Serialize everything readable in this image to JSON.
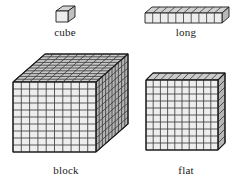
{
  "page": {
    "background_color": "#ffffff",
    "width": 236,
    "height": 184
  },
  "style": {
    "stroke_color": "#1c1c1c",
    "face_front_color": "#e9e9e9",
    "face_top_color": "#d0d0d0",
    "face_side_color": "#bdbdbd",
    "grid_line_color": "#3a3a3a",
    "label_color": "#1a1a1a"
  },
  "figures": [
    {
      "id": "cube",
      "label": "cube",
      "icon": "unit-cube-icon",
      "units": 1,
      "dimensions": {
        "width": 1,
        "height": 1,
        "depth": 1
      },
      "front_grid": {
        "cols": 1,
        "rows": 1
      },
      "top_grid": {
        "cols": 1,
        "rows": 1
      },
      "side_grid": {
        "cols": 1,
        "rows": 1
      }
    },
    {
      "id": "long",
      "label": "long",
      "icon": "rod-of-ten-icon",
      "units": 10,
      "dimensions": {
        "width": 10,
        "height": 1,
        "depth": 1
      },
      "front_grid": {
        "cols": 10,
        "rows": 1
      },
      "top_grid": {
        "cols": 10,
        "rows": 1
      },
      "side_grid": {
        "cols": 1,
        "rows": 1
      }
    },
    {
      "id": "block",
      "label": "block",
      "icon": "thousand-cube-icon",
      "units": 1000,
      "dimensions": {
        "width": 10,
        "height": 10,
        "depth": 10
      },
      "front_grid": {
        "cols": 10,
        "rows": 10
      },
      "top_grid": {
        "cols": 10,
        "rows": 10
      },
      "side_grid": {
        "cols": 10,
        "rows": 10
      }
    },
    {
      "id": "flat",
      "label": "flat",
      "icon": "hundred-flat-icon",
      "units": 100,
      "dimensions": {
        "width": 10,
        "height": 10,
        "depth": 1
      },
      "front_grid": {
        "cols": 10,
        "rows": 10
      },
      "top_grid": {
        "cols": 10,
        "rows": 1
      },
      "side_grid": {
        "cols": 1,
        "rows": 10
      }
    }
  ],
  "captions": {
    "cube": "cube",
    "long": "long",
    "block": "block",
    "flat": "flat"
  }
}
